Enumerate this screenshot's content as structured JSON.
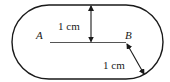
{
  "diagram": {
    "type": "geometry",
    "shape": "stadium",
    "colors": {
      "stroke": "#1a1a1a",
      "segment": "#555555",
      "background": "#ffffff"
    },
    "points": [
      {
        "id": "A",
        "label": "A"
      },
      {
        "id": "B",
        "label": "B"
      }
    ],
    "segment": {
      "from": "A",
      "to": "B"
    },
    "measurements": [
      {
        "id": "vertical",
        "label": "1 cm",
        "description": "distance from segment AB to top boundary"
      },
      {
        "id": "diagonal",
        "label": "1 cm",
        "description": "radius from B to the curved boundary"
      }
    ]
  }
}
